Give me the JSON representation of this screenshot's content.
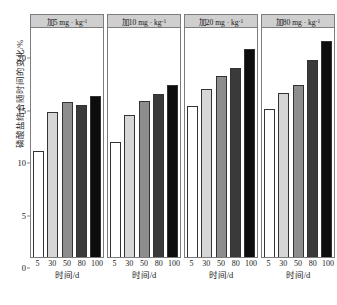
{
  "chart_data": {
    "type": "bar",
    "title": "",
    "subtitle": "",
    "xlabel": "时间/d",
    "ylabel": "磷酸盐结合随时间的变化/%",
    "ylim": [
      0,
      22
    ],
    "yticks": [
      0,
      5,
      10,
      15,
      20
    ],
    "ytick_labels": [
      "0",
      "5",
      "10",
      "15",
      "20"
    ],
    "grid": false,
    "legend_position": "none",
    "categories": [
      "5",
      "30",
      "50",
      "80",
      "100"
    ],
    "panel_layout": "1x4 trellis",
    "panels": [
      {
        "label": "加5 mg · kg",
        "label_sup": "-1",
        "values": [
          10.1,
          13.8,
          14.8,
          14.5,
          15.3
        ]
      },
      {
        "label": "加10 mg · kg",
        "label_sup": "-1",
        "values": [
          11.0,
          13.5,
          14.9,
          15.5,
          16.4
        ]
      },
      {
        "label": "加20 mg · kg",
        "label_sup": "-1",
        "values": [
          14.4,
          16.0,
          17.2,
          18.0,
          19.8
        ]
      },
      {
        "label": "加80 mg · kg",
        "label_sup": "-1",
        "values": [
          14.1,
          15.6,
          16.4,
          18.8,
          20.6
        ]
      }
    ],
    "bar_colors": [
      "#ffffff",
      "#d6d6d6",
      "#8d8d8d",
      "#3a3a3a",
      "#0d0d0d"
    ],
    "bar_edge_color": "#333333",
    "panel_header_color": "#cfcfcf",
    "frame_color": "#7d7d7d"
  },
  "caption": "",
  "x_axis_titles": [
    "时间/d",
    "时间/d",
    "时间/d",
    "时间/d"
  ]
}
